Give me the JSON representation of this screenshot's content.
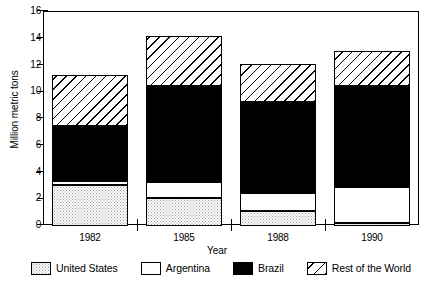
{
  "chart_data": {
    "type": "bar",
    "stacked": true,
    "title": "",
    "xlabel": "Year",
    "ylabel": "Million metric tons",
    "categories": [
      "1982",
      "1985",
      "1988",
      "1990"
    ],
    "ylim": [
      0,
      16
    ],
    "yticks": [
      0,
      2,
      4,
      6,
      8,
      10,
      12,
      14,
      16
    ],
    "ytick_labels": [
      "0",
      "2",
      "4",
      "6",
      "8",
      "10",
      "12",
      "14",
      "16"
    ],
    "grid": false,
    "legend_position": "bottom",
    "series": [
      {
        "name": "United States",
        "pattern": "dotted",
        "values": [
          3.1,
          2.1,
          1.1,
          0.2
        ]
      },
      {
        "name": "Argentina",
        "pattern": "white",
        "values": [
          0.3,
          1.2,
          1.4,
          2.7
        ]
      },
      {
        "name": "Brazil",
        "pattern": "black",
        "values": [
          4.1,
          7.2,
          6.8,
          7.6
        ]
      },
      {
        "name": "Rest of the World",
        "pattern": "hatch",
        "values": [
          3.8,
          3.7,
          2.8,
          2.6
        ]
      }
    ],
    "totals": [
      11.3,
      14.2,
      12.1,
      13.1
    ]
  },
  "legend": {
    "items": [
      {
        "label": "United States",
        "pattern": "dotted"
      },
      {
        "label": "Argentina",
        "pattern": "white"
      },
      {
        "label": "Brazil",
        "pattern": "black"
      },
      {
        "label": "Rest of the World",
        "pattern": "hatch"
      }
    ]
  }
}
